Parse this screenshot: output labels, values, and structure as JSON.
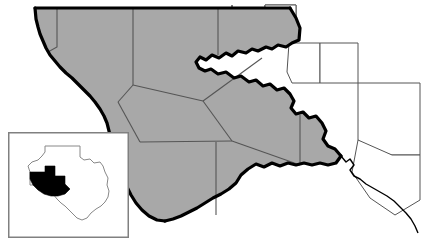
{
  "figure": {
    "width": 439,
    "height": 252,
    "background_color": "#ffffff"
  },
  "colors": {
    "region_fill": "#a8a8a8",
    "neighbor_fill": "#ffffff",
    "county_line": "#555555",
    "state_border": "#000000",
    "river_border": "#000000",
    "inset_frame": "#808080",
    "inset_outline": "#888888",
    "inset_highlight": "#000000",
    "page_background": "#ffffff"
  },
  "main_map": {
    "name": "west-texas-region",
    "fill": "#a8a8a8",
    "border_style": "thick-black",
    "north_border": {
      "name": "state-line-north",
      "style": "straight-horizontal",
      "stroke": "#000000",
      "stroke_width": 3
    },
    "west_border": {
      "name": "rio-grande-west",
      "style": "irregular-river",
      "stroke": "#000000",
      "stroke_width": 3
    },
    "south_border": {
      "name": "rio-grande-south",
      "style": "irregular-river",
      "stroke": "#000000",
      "stroke_width": 3
    },
    "shaded_county_count": 8,
    "unshaded_county_count": 7,
    "counties_shaded": [
      {
        "name": "county-nw",
        "fill": "#a8a8a8"
      },
      {
        "name": "county-n-central",
        "fill": "#a8a8a8"
      },
      {
        "name": "county-ne",
        "fill": "#a8a8a8"
      },
      {
        "name": "county-central",
        "fill": "#a8a8a8"
      },
      {
        "name": "county-w-central",
        "fill": "#a8a8a8"
      },
      {
        "name": "county-east",
        "fill": "#a8a8a8"
      },
      {
        "name": "county-sw",
        "fill": "#a8a8a8"
      },
      {
        "name": "county-se",
        "fill": "#a8a8a8"
      }
    ],
    "counties_unshaded": [
      {
        "name": "neighbor-county-n1",
        "fill": "#ffffff"
      },
      {
        "name": "neighbor-county-n2",
        "fill": "#ffffff"
      },
      {
        "name": "neighbor-county-n3",
        "fill": "#ffffff"
      },
      {
        "name": "neighbor-county-ne1",
        "fill": "#ffffff"
      },
      {
        "name": "neighbor-county-ne2",
        "fill": "#ffffff"
      },
      {
        "name": "neighbor-county-e1",
        "fill": "#ffffff"
      },
      {
        "name": "neighbor-county-e2",
        "fill": "#ffffff"
      }
    ]
  },
  "inset": {
    "name": "texas-locator-inset",
    "frame": {
      "x": 8,
      "y": 132,
      "width": 121,
      "height": 106,
      "stroke": "#808080",
      "fill": "#ffffff"
    },
    "state_outline": {
      "name": "texas-state-outline",
      "stroke": "#888888",
      "fill": "#ffffff"
    },
    "highlight": {
      "name": "west-texas-highlight",
      "fill": "#000000",
      "position": "west"
    }
  }
}
